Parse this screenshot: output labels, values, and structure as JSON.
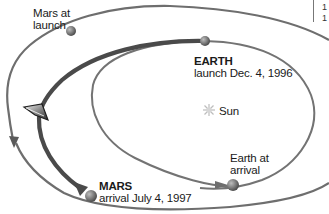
{
  "diagram": {
    "type": "orbital-transfer",
    "colors": {
      "background": "#ffffff",
      "orbit_line": "#6e6e6e",
      "transfer_path": "#4a4a4a",
      "planet": "#7a7a7a",
      "sun": "#c8c8c8",
      "text": "#1a1a1a"
    },
    "labels": {
      "mars_at_launch": {
        "line1": "Mars at",
        "line2": "launch"
      },
      "earth_launch": {
        "title": "EARTH",
        "subtitle": "launch Dec. 4, 1996"
      },
      "sun": "Sun",
      "earth_at_arrival": {
        "line1": "Earth at",
        "line2": "arrival"
      },
      "mars_arrival": {
        "title": "MARS",
        "subtitle": "arrival July 4, 1997"
      }
    },
    "nodes": [
      {
        "id": "mars-at-launch",
        "x": 71,
        "y": 30
      },
      {
        "id": "earth-at-launch",
        "x": 205,
        "y": 41
      },
      {
        "id": "sun",
        "x": 212,
        "y": 110
      },
      {
        "id": "earth-at-arrival",
        "x": 233,
        "y": 185
      },
      {
        "id": "mars-at-arrival",
        "x": 91,
        "y": 196
      },
      {
        "id": "spacecraft",
        "x": 39,
        "y": 113
      }
    ],
    "edges": [
      {
        "from": "earth-at-launch",
        "to": "mars-at-arrival",
        "label": "transfer trajectory"
      }
    ],
    "corner_text": [
      "1",
      "1"
    ]
  }
}
